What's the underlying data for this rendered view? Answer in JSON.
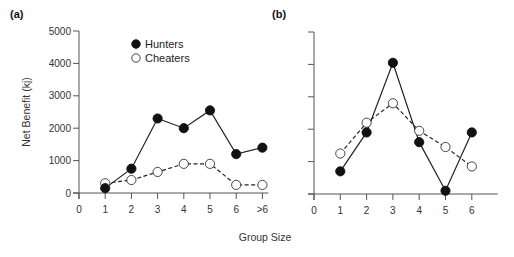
{
  "chart_data": [
    {
      "type": "line",
      "panel_label": "(a)",
      "title": "",
      "xlabel": "Group Size",
      "ylabel": "Net Benefit (kj)",
      "ylim": [
        0,
        5000
      ],
      "yticks": [
        0,
        1000,
        2000,
        3000,
        4000,
        5000
      ],
      "xticks": [
        "0",
        "1",
        "2",
        "3",
        "4",
        "5",
        "6",
        ">6"
      ],
      "categories": [
        "1",
        "2",
        "3",
        "4",
        "5",
        "6",
        ">6"
      ],
      "grid": false,
      "legend_position": "upper-center",
      "series": [
        {
          "name": "Hunters",
          "marker": "filled-circle",
          "line": "solid",
          "values": [
            150,
            750,
            2300,
            2000,
            2550,
            1200,
            1400
          ]
        },
        {
          "name": "Cheaters",
          "marker": "open-circle",
          "line": "dashed",
          "values": [
            300,
            400,
            650,
            900,
            900,
            250,
            250
          ]
        }
      ]
    },
    {
      "type": "line",
      "panel_label": "(b)",
      "title": "",
      "xlabel": "Group Size",
      "ylabel": "Net Benefit (kj)",
      "ylim": [
        0,
        5000
      ],
      "yticks": [
        0,
        1000,
        2000,
        3000,
        4000,
        5000
      ],
      "xticks": [
        "0",
        "1",
        "2",
        "3",
        "4",
        "5",
        "6"
      ],
      "categories": [
        "1",
        "2",
        "3",
        "4",
        "5",
        "6"
      ],
      "grid": false,
      "series": [
        {
          "name": "Hunters",
          "marker": "filled-circle",
          "line": "solid",
          "values": [
            700,
            1900,
            4050,
            1600,
            100,
            1900
          ]
        },
        {
          "name": "Cheaters",
          "marker": "open-circle",
          "line": "dashed",
          "values": [
            1250,
            2200,
            2800,
            1950,
            1450,
            850
          ]
        }
      ]
    }
  ],
  "labels": {
    "panel_a": "(a)",
    "panel_b": "(b)",
    "ylabel": "Net Benefit (kj)",
    "xlabel": "Group Size",
    "legend_hunters": "Hunters",
    "legend_cheaters": "Cheaters"
  },
  "colors": {
    "axis": "#555555",
    "line": "#222222",
    "marker_fill": "#111111",
    "open_marker_fill": "#ffffff"
  }
}
